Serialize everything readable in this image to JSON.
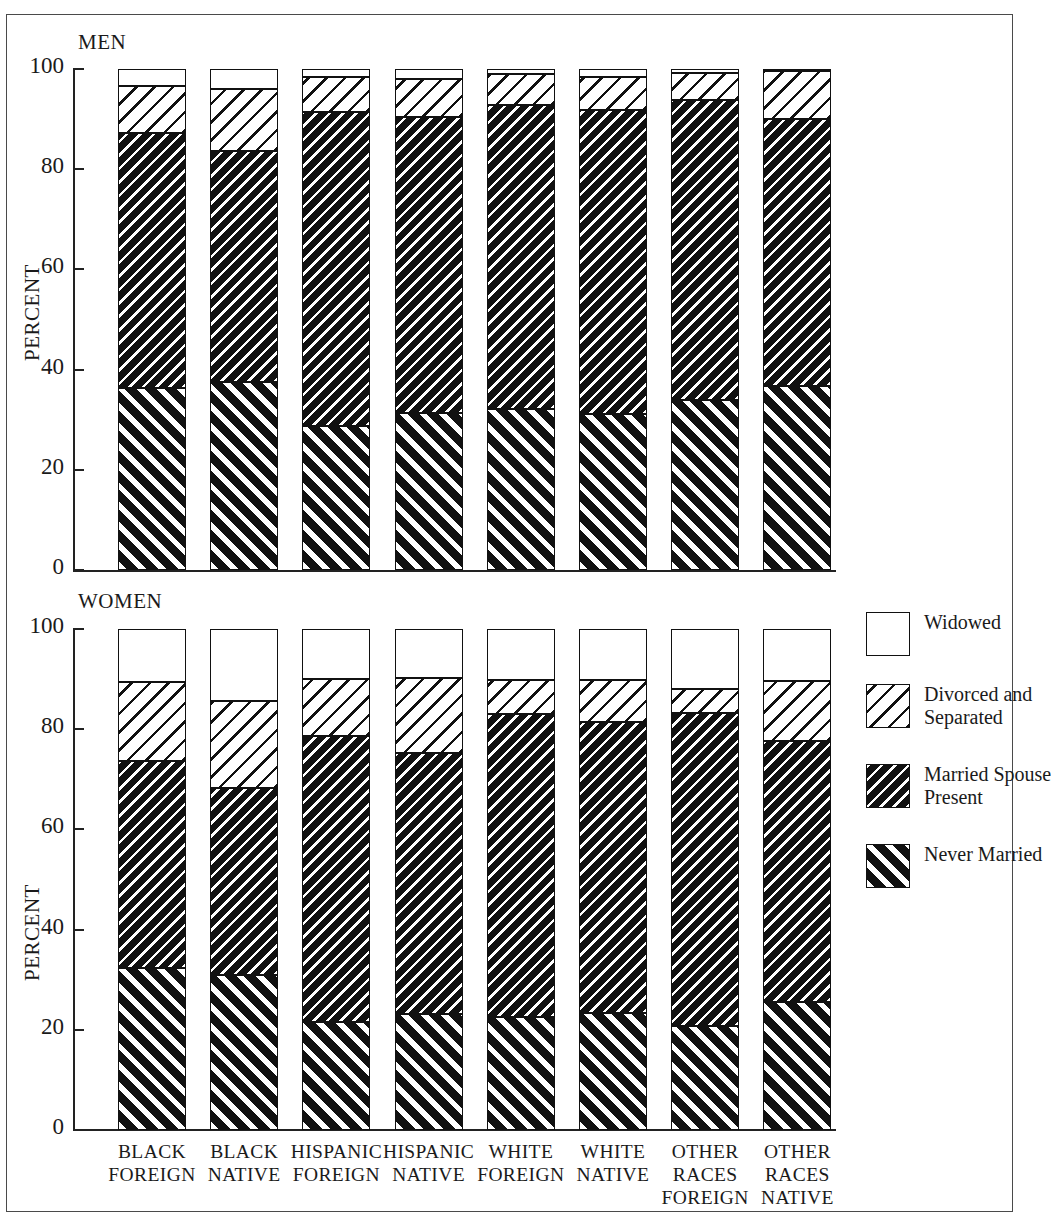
{
  "figure": {
    "border_color": "#4a4a4a",
    "axis_label": "PERCENT"
  },
  "panels": [
    {
      "title": "MEN",
      "axis_label": "PERCENT"
    },
    {
      "title": "WOMEN",
      "axis_label": "PERCENT"
    }
  ],
  "axis": {
    "ticks": [
      "100",
      "80",
      "60",
      "40",
      "20",
      "0"
    ],
    "min": 0,
    "max": 100
  },
  "legend": {
    "items": [
      {
        "label": "Widowed",
        "pattern": "widowed-swatch"
      },
      {
        "label": "Divorced and\nSeparated",
        "pattern": "divorced-swatch"
      },
      {
        "label": "Married Spouse\nPresent",
        "pattern": "married-swatch"
      },
      {
        "label": "Never Married",
        "pattern": "never-married-swatch"
      }
    ],
    "labels_flat": [
      "Widowed",
      "Divorced and Separated",
      "Married Spouse Present",
      "Never Married"
    ]
  },
  "categories": [
    {
      "lines": [
        "BLACK",
        "FOREIGN"
      ]
    },
    {
      "lines": [
        "BLACK",
        "NATIVE"
      ]
    },
    {
      "lines": [
        "HISPANIC",
        "FOREIGN"
      ]
    },
    {
      "lines": [
        "HISPANIC",
        "NATIVE"
      ]
    },
    {
      "lines": [
        "WHITE",
        "FOREIGN"
      ]
    },
    {
      "lines": [
        "WHITE",
        "NATIVE"
      ]
    },
    {
      "lines": [
        "OTHER",
        "RACES",
        "FOREIGN"
      ]
    },
    {
      "lines": [
        "OTHER",
        "RACES",
        "NATIVE"
      ]
    }
  ],
  "chart_data": {
    "type": "bar",
    "subtype": "stacked-bar-100pct",
    "title": "",
    "xlabel": "",
    "ylabel": "PERCENT",
    "ylim": [
      0,
      100
    ],
    "yticks": [
      0,
      20,
      40,
      60,
      80,
      100
    ],
    "grid": false,
    "legend_position": "right",
    "categories": [
      "BLACK FOREIGN",
      "BLACK NATIVE",
      "HISPANIC FOREIGN",
      "HISPANIC NATIVE",
      "WHITE FOREIGN",
      "WHITE NATIVE",
      "OTHER RACES FOREIGN",
      "OTHER RACES NATIVE"
    ],
    "panels": [
      {
        "name": "MEN",
        "series": [
          {
            "name": "Never Married",
            "values": [
              36.3,
              37.6,
              28.8,
              31.4,
              32.2,
              31.2,
              33.9,
              36.7
            ]
          },
          {
            "name": "Married Spouse Present",
            "values": [
              51.0,
              46.1,
              62.7,
              59.0,
              60.7,
              60.6,
              59.9,
              53.4
            ]
          },
          {
            "name": "Divorced and Separated",
            "values": [
              9.4,
              12.3,
              6.9,
              7.6,
              6.1,
              6.7,
              5.5,
              9.6
            ]
          },
          {
            "name": "Widowed",
            "values": [
              3.3,
              4.0,
              1.6,
              2.0,
              1.0,
              1.5,
              0.7,
              0.3
            ]
          }
        ]
      },
      {
        "name": "WOMEN",
        "series": [
          {
            "name": "Never Married",
            "values": [
              32.4,
              31.0,
              21.6,
              23.2,
              22.6,
              23.4,
              20.8,
              25.6
            ]
          },
          {
            "name": "Married Spouse Present",
            "values": [
              41.2,
              37.2,
              57.0,
              52.0,
              60.4,
              58.0,
              62.4,
              52.0
            ]
          },
          {
            "name": "Divorced and Separated",
            "values": [
              15.8,
              17.4,
              11.4,
              15.0,
              6.8,
              8.4,
              4.8,
              12.0
            ]
          },
          {
            "name": "Widowed",
            "values": [
              10.6,
              14.4,
              10.0,
              9.8,
              10.2,
              10.2,
              12.0,
              10.4
            ]
          }
        ]
      }
    ]
  }
}
